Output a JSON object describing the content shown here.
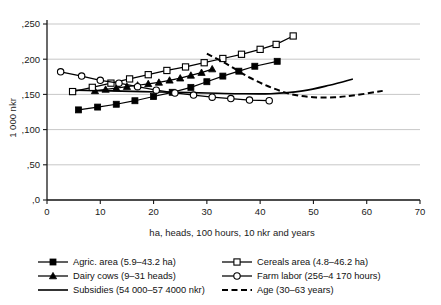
{
  "chart_data": {
    "type": "line",
    "title": "",
    "xlabel": "ha, heads, 100 hours, 10 nkr and years",
    "ylabel": "1 000 nkr",
    "xlim": [
      0,
      70
    ],
    "ylim": [
      0,
      250
    ],
    "xticks": [
      "0",
      "10",
      "20",
      "30",
      "40",
      "50",
      "60",
      "70"
    ],
    "xtick_values": [
      0,
      10,
      20,
      30,
      40,
      50,
      60,
      70
    ],
    "yticks": [
      ",0",
      ",50",
      ",100",
      ",150",
      ",200",
      ",250"
    ],
    "ytick_values": [
      0,
      50,
      100,
      150,
      200,
      250
    ],
    "grid": "horizontal",
    "legend_position": "below",
    "series": [
      {
        "name": "Agric. area (5.9–43.2 ha)",
        "marker": "filled-square",
        "linestyle": "solid",
        "x": [
          5.9,
          9.5,
          13.0,
          16.5,
          20.0,
          23.5,
          27.0,
          30.0,
          33.0,
          36.0,
          39.0,
          43.2
        ],
        "y": [
          128,
          132,
          136,
          141,
          147,
          153,
          160,
          168,
          176,
          183,
          190,
          197
        ]
      },
      {
        "name": "Dairy cows (9–31 heads)",
        "marker": "filled-triangle",
        "linestyle": "solid",
        "x": [
          9,
          11,
          13,
          15,
          17,
          19,
          21,
          23,
          25,
          27,
          29,
          31
        ],
        "y": [
          155,
          157,
          159,
          161,
          163,
          165,
          167,
          170,
          173,
          177,
          181,
          186
        ]
      },
      {
        "name": "Subsidies (54 000–57 4000 nkr)",
        "marker": "none",
        "linestyle": "solid",
        "x": [
          5.4,
          12,
          18,
          24,
          30,
          36,
          42,
          48,
          53,
          57.4
        ],
        "y": [
          156,
          155,
          154,
          153,
          152,
          151,
          151,
          155,
          163,
          172
        ]
      },
      {
        "name": "Cereals area (4.8–46.2 ha)",
        "marker": "open-square",
        "linestyle": "solid",
        "x": [
          4.8,
          8.5,
          12.0,
          15.5,
          19.0,
          22.5,
          26.0,
          29.5,
          33.0,
          36.5,
          40.0,
          43.0,
          46.2
        ],
        "y": [
          154,
          160,
          166,
          172,
          178,
          184,
          189,
          195,
          201,
          207,
          214,
          221,
          233
        ]
      },
      {
        "name": "Farm labor (256–4 170 hours)",
        "marker": "open-circle",
        "linestyle": "solid",
        "x": [
          2.56,
          6.5,
          10.0,
          13.5,
          17.0,
          20.5,
          24.0,
          27.5,
          31.0,
          34.5,
          38.0,
          41.7
        ],
        "y": [
          182,
          176,
          170,
          166,
          161,
          156,
          152,
          149,
          146,
          144,
          142,
          141
        ]
      },
      {
        "name": "Age (30–63 years)",
        "marker": "none",
        "linestyle": "dashed",
        "x": [
          30,
          34,
          38,
          42,
          46,
          50,
          54,
          58,
          63
        ],
        "y": [
          208,
          192,
          174,
          160,
          150,
          146,
          146,
          149,
          155
        ]
      }
    ]
  },
  "legend": {
    "items": [
      {
        "label": "Agric. area (5.9–43.2 ha)",
        "marker": "filled-square",
        "style": "solid"
      },
      {
        "label": "Cereals area (4.8–46.2 ha)",
        "marker": "open-square",
        "style": "solid"
      },
      {
        "label": "Dairy cows (9–31 heads)",
        "marker": "filled-triangle",
        "style": "solid"
      },
      {
        "label": "Farm labor (256–4 170 hours)",
        "marker": "open-circle",
        "style": "solid"
      },
      {
        "label": "Subsidies (54 000–57 4000 nkr)",
        "marker": "none",
        "style": "solid"
      },
      {
        "label": "Age (30–63 years)",
        "marker": "none",
        "style": "dashed"
      }
    ]
  },
  "colors": {
    "series": "#000000",
    "grid": "#b9b9b9",
    "axis": "#1a1a1a",
    "background": "#ffffff"
  }
}
